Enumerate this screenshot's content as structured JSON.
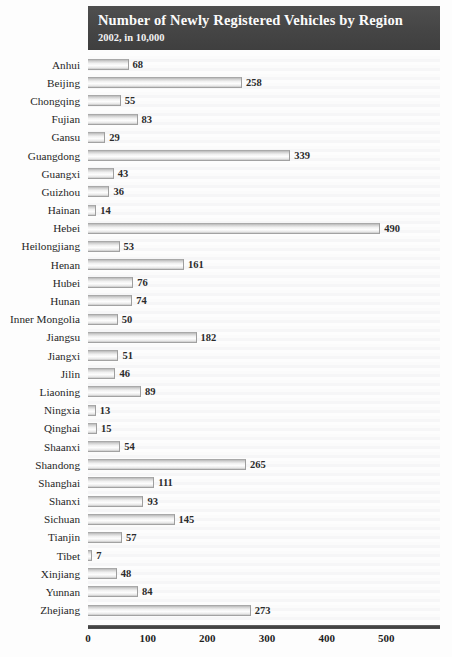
{
  "header": {
    "title": "Number of Newly Registered Vehicles by Region",
    "subtitle": "2002, in 10,000"
  },
  "chart_data": {
    "type": "bar",
    "orientation": "horizontal",
    "title": "Number of Newly Registered Vehicles by Region",
    "subtitle": "2002, in 10,000",
    "xlabel": "",
    "ylabel": "",
    "xlim": [
      0,
      590
    ],
    "grid": false,
    "legend": null,
    "value_labels": true,
    "units": "10,000 vehicles",
    "year": "2002",
    "xticks": [
      0,
      100,
      200,
      300,
      400,
      500
    ],
    "xtick_labels": [
      "0",
      "100",
      "200",
      "300",
      "400",
      "500"
    ],
    "categories": [
      "Anhui",
      "Beijing",
      "Chongqing",
      "Fujian",
      "Gansu",
      "Guangdong",
      "Guangxi",
      "Guizhou",
      "Hainan",
      "Hebei",
      "Heilongjiang",
      "Henan",
      "Hubei",
      "Hunan",
      "Inner Mongolia",
      "Jiangsu",
      "Jiangxi",
      "Jilin",
      "Liaoning",
      "Ningxia",
      "Qinghai",
      "Shaanxi",
      "Shandong",
      "Shanghai",
      "Shanxi",
      "Sichuan",
      "Tianjin",
      "Tibet",
      "Xinjiang",
      "Yunnan",
      "Zhejiang"
    ],
    "values": [
      68,
      258,
      55,
      83,
      29,
      339,
      43,
      36,
      14,
      490,
      53,
      161,
      76,
      74,
      50,
      182,
      51,
      46,
      89,
      13,
      15,
      54,
      265,
      111,
      93,
      145,
      57,
      7,
      48,
      84,
      273
    ],
    "colors": {
      "header_background": "#4a4a4a",
      "header_text": "#ffffff",
      "plot_background": "#fafafa",
      "bar_fill": "#eeeeee",
      "bar_border": "#a0a0a0",
      "axis": "#3b3b3b",
      "label_text": "#262626"
    }
  }
}
